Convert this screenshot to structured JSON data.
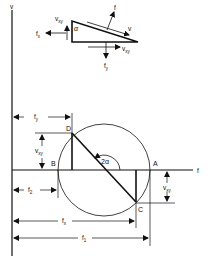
{
  "diagram": {
    "colors": {
      "ink": "#111111",
      "background": "#ffffff"
    },
    "element": {
      "labels": {
        "alpha": "α",
        "vxy_left": "v",
        "vxy_left_sub": "xy",
        "fx": "f",
        "fx_sub": "x",
        "f": "f",
        "v": "v",
        "vxy_bottom": "v",
        "vxy_bottom_sub": "xy",
        "fy": "f",
        "fy_sub": "y"
      }
    },
    "axes": {
      "vertical_label": "v",
      "horizontal_label": "f"
    },
    "circle": {
      "points": {
        "A": "A",
        "B": "B",
        "C": "C",
        "D": "D"
      },
      "angle_label": "2α"
    },
    "dimensions": {
      "fy": {
        "main": "f",
        "sub": "y"
      },
      "vxy_left": {
        "main": "v",
        "sub": "xy"
      },
      "f2": {
        "main": "f",
        "sub": "2"
      },
      "vxy_right": {
        "main": "v",
        "sub": "xy"
      },
      "fx": {
        "main": "f",
        "sub": "x"
      },
      "f1": {
        "main": "f",
        "sub": "1"
      }
    }
  }
}
